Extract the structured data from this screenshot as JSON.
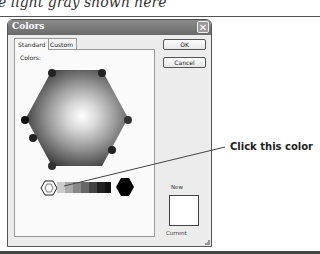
{
  "document": {
    "caption_fragment": "e light gray shown here",
    "callout": "Click this color"
  },
  "dialog": {
    "title": "Colors",
    "close_icon": "close-icon",
    "tabs": [
      {
        "label": "Standard",
        "active": true
      },
      {
        "label": "Custom",
        "active": false
      }
    ],
    "colors_label": "Colors:",
    "buttons": {
      "ok": "OK",
      "cancel": "Cancel"
    },
    "preview": {
      "new_label": "New",
      "current_label": "Current",
      "new_color": "#ffffff",
      "current_color": "#ffffff"
    },
    "grayscale_row": {
      "swatches": [
        "#ffffff",
        "#dddddd",
        "#bbbbbb",
        "#999999",
        "#777777",
        "#555555",
        "#333333",
        "#222222",
        "#111111",
        "#000000"
      ],
      "selected_index": 0
    }
  }
}
